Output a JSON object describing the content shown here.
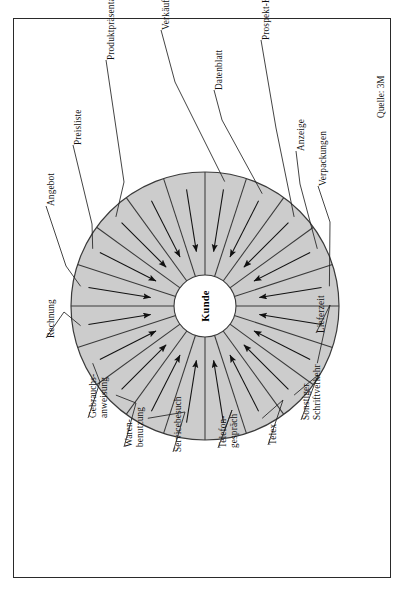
{
  "figure": {
    "kind": "customer-contact-wheel",
    "center_label": "Kunde",
    "source_label": "Quelle: 3M",
    "orientation": "rotated-90-ccw",
    "colors": {
      "segment_fill": "#cccccc",
      "segment_stroke": "#3a3a3a",
      "frame_stroke": "#2a2a2a",
      "hub_fill": "#ffffff",
      "text": "#111111"
    }
  },
  "chart_data": {
    "type": "pie",
    "title": "Kunde",
    "subtitle": "Quelle: 3M",
    "categories": [
      "Verkäuferkontakt",
      "Datenblatt",
      "Prospekt-Katalog",
      "Anzeige",
      "Verpackungen",
      "Lieferzeit",
      "Sonstiger Schriftverkehr",
      "Telex",
      "Telefongespräch",
      "Servicebesuch",
      "Waren-benutzung",
      "Gebrauchs-anweisung",
      "Rechnung",
      "Angebot",
      "Preisliste",
      "Produktpräsentation"
    ],
    "values": [
      1,
      1,
      1,
      1,
      1,
      1,
      1,
      1,
      1,
      1,
      1,
      1,
      1,
      1,
      1,
      1
    ],
    "slice_count": 20,
    "legend": "none",
    "grid": false
  },
  "segments": [
    {
      "label": "Verkäuferkontakt",
      "lines": [
        "Verkäuferkontakt"
      ],
      "arrow": "inward"
    },
    {
      "label": "Datenblatt",
      "lines": [
        "Datenblatt"
      ],
      "arrow": "inward"
    },
    {
      "label": "Prospekt-Katalog",
      "lines": [
        "Prospekt-Katalog"
      ],
      "arrow": "inward"
    },
    {
      "label": "Anzeige",
      "lines": [
        "Anzeige"
      ],
      "arrow": "inward"
    },
    {
      "label": "Verpackungen",
      "lines": [
        "Verpackungen"
      ],
      "arrow": "inward"
    },
    {
      "label": "Lieferzeit",
      "lines": [
        "Lieferzeit"
      ],
      "arrow": "inward"
    },
    {
      "label": "Sonstiger Schriftverkehr",
      "lines": [
        "Sonstiger",
        "Schriftverkehr"
      ],
      "arrow": "inward"
    },
    {
      "label": "Telex",
      "lines": [
        "Telex"
      ],
      "arrow": "inward"
    },
    {
      "label": "Telefongespräch",
      "lines": [
        "Telefon-",
        "gespräch"
      ],
      "arrow": "inward"
    },
    {
      "label": "Servicebesuch",
      "lines": [
        "Servicebesuch"
      ],
      "arrow": "inward"
    },
    {
      "label": "Warenbenutzung",
      "lines": [
        "Waren-",
        "benutzung"
      ],
      "arrow": "inward"
    },
    {
      "label": "Gebrauchsanweisung",
      "lines": [
        "Gebrauchs-",
        "anweisung"
      ],
      "arrow": "inward"
    },
    {
      "label": "Rechnung",
      "lines": [
        "Rechnung"
      ],
      "arrow": "inward"
    },
    {
      "label": "Angebot",
      "lines": [
        "Angebot"
      ],
      "arrow": "inward"
    },
    {
      "label": "Preisliste",
      "lines": [
        "Preisliste"
      ],
      "arrow": "inward"
    },
    {
      "label": "Produktpräsentation",
      "lines": [
        "Produktpräsentation"
      ],
      "arrow": "inward"
    }
  ]
}
